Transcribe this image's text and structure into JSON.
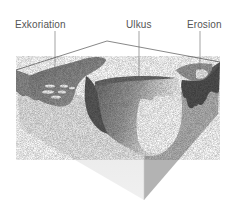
{
  "figure": {
    "type": "skin-lesion-block-diagram",
    "labels": [
      {
        "id": "exkoriation",
        "text": "Exkoriation"
      },
      {
        "id": "ulkus",
        "text": "Ulkus"
      },
      {
        "id": "erosion",
        "text": "Erosion"
      }
    ]
  },
  "colors": {
    "background": "#ffffff",
    "top_surface": "#ffffff",
    "left_face": "#ebebeb",
    "right_face": "#b5b5b5",
    "lesion_dark": "#555555",
    "lesion_mid": "#8a8a8a",
    "label_text": "#555555",
    "leader_line": "#666666"
  }
}
